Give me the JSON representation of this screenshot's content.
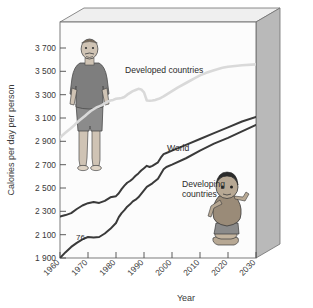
{
  "chart_data": {
    "type": "line",
    "title": "",
    "xlabel": "Year",
    "ylabel": "Calories per day per person",
    "xlim": [
      1960,
      2030
    ],
    "ylim": [
      1900,
      3800
    ],
    "xticks": [
      "1960",
      "1970",
      "1980",
      "1990",
      "2000",
      "2010",
      "2020",
      "2030"
    ],
    "yticks": [
      "1 900",
      "2 100",
      "2 300",
      "2 500",
      "2 700",
      "2 900",
      "3 100",
      "3 300",
      "3 500",
      "3 700"
    ],
    "grid": false,
    "legend_position": "inline-labels",
    "annotations": [
      {
        "text": "76",
        "x": 1967,
        "y": 2140
      }
    ],
    "series": [
      {
        "name": "Developed countries",
        "color": "#d9d9d9",
        "label_x": 1978,
        "label_y": 3520,
        "x": [
          1960,
          1961,
          1962,
          1963,
          1964,
          1965,
          1966,
          1967,
          1968,
          1969,
          1970,
          1971,
          1972,
          1973,
          1974,
          1975,
          1976,
          1977,
          1978,
          1979,
          1980,
          1981,
          1982,
          1983,
          1984,
          1985,
          1986,
          1987,
          1988,
          1989,
          1990,
          1991,
          1992,
          1993,
          1994,
          1995,
          1996,
          1997,
          1998,
          1999,
          2000,
          2002,
          2005,
          2008,
          2010,
          2012,
          2015,
          2018,
          2020,
          2025,
          2030
        ],
        "y": [
          2930,
          2955,
          2975,
          2995,
          3015,
          3035,
          3060,
          3080,
          3100,
          3120,
          3140,
          3160,
          3175,
          3190,
          3200,
          3210,
          3225,
          3240,
          3250,
          3255,
          3265,
          3268,
          3272,
          3280,
          3300,
          3315,
          3330,
          3340,
          3350,
          3345,
          3320,
          3250,
          3248,
          3250,
          3255,
          3262,
          3272,
          3285,
          3300,
          3315,
          3330,
          3360,
          3400,
          3440,
          3465,
          3485,
          3510,
          3530,
          3540,
          3552,
          3560
        ]
      },
      {
        "name": "World",
        "color": "#3a3a3a",
        "label_x": 1988,
        "label_y": 2880,
        "x": [
          1960,
          1962,
          1964,
          1966,
          1968,
          1970,
          1972,
          1974,
          1976,
          1978,
          1980,
          1981,
          1982,
          1983,
          1984,
          1985,
          1986,
          1987,
          1988,
          1989,
          1990,
          1991,
          1992,
          1993,
          1994,
          1995,
          1996,
          1997,
          1998,
          2000,
          2005,
          2010,
          2015,
          2020,
          2025,
          2030
        ],
        "y": [
          2255,
          2268,
          2285,
          2320,
          2350,
          2370,
          2380,
          2372,
          2390,
          2420,
          2430,
          2455,
          2490,
          2520,
          2545,
          2560,
          2580,
          2605,
          2625,
          2650,
          2670,
          2690,
          2680,
          2690,
          2705,
          2720,
          2760,
          2790,
          2800,
          2820,
          2870,
          2920,
          2970,
          3020,
          3070,
          3110
        ]
      },
      {
        "name": "Developing countries",
        "color": "#3a3a3a",
        "label_x": 1997,
        "label_y": 2560,
        "x": [
          1960,
          1962,
          1964,
          1966,
          1968,
          1970,
          1972,
          1974,
          1976,
          1978,
          1980,
          1981,
          1982,
          1983,
          1984,
          1985,
          1986,
          1987,
          1988,
          1989,
          1990,
          1991,
          1992,
          1993,
          1994,
          1995,
          1996,
          1997,
          1998,
          2000,
          2005,
          2010,
          2015,
          2020,
          2025,
          2030
        ],
        "y": [
          1900,
          1950,
          1995,
          2030,
          2060,
          2080,
          2075,
          2080,
          2110,
          2150,
          2200,
          2250,
          2285,
          2310,
          2340,
          2360,
          2385,
          2400,
          2420,
          2450,
          2480,
          2510,
          2525,
          2540,
          2560,
          2580,
          2620,
          2660,
          2680,
          2700,
          2755,
          2820,
          2880,
          2930,
          2985,
          3040
        ]
      }
    ]
  },
  "figure_illustrations": [
    {
      "name": "overweight-man",
      "caption": ""
    },
    {
      "name": "malnourished-child",
      "caption": ""
    }
  ]
}
